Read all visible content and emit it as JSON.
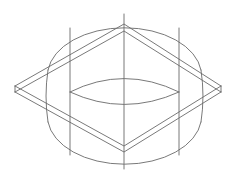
{
  "drawing": {
    "type": "wireframe",
    "subject": "cylinder intersected by square slab (isometric view)",
    "stroke_color": "#6a6a6a",
    "background": "#ffffff",
    "cylinder": {
      "center_x": 124.5,
      "radius_x": 77,
      "radius_y": 47.6,
      "top_center_y": 61.6,
      "bottom_center_y": 121.4
    },
    "slab": {
      "left": [
        15,
        89
      ],
      "top": [
        124,
        24
      ],
      "right": [
        221,
        89
      ],
      "bottom": [
        124,
        152
      ],
      "thickness": 6
    }
  }
}
